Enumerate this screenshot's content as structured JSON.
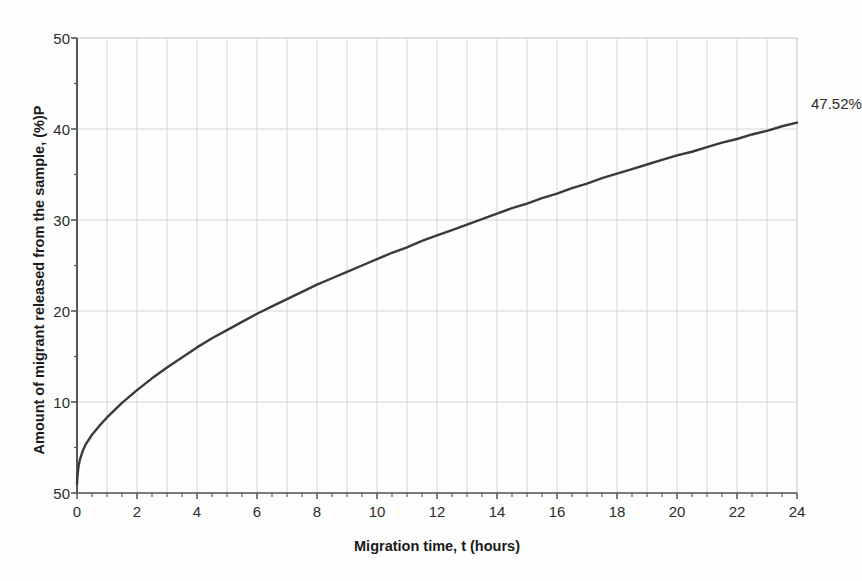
{
  "chart_data": {
    "type": "line",
    "title": "",
    "xlabel": "Migration time, t   (hours)",
    "ylabel": "Amount of migrant released from the sample, (%)P",
    "xlim": [
      0,
      24
    ],
    "ylim": [
      0,
      50
    ],
    "grid": true,
    "legend": null,
    "xticks": [
      0,
      2,
      4,
      6,
      8,
      10,
      12,
      14,
      16,
      18,
      20,
      22,
      24
    ],
    "xtick_labels": [
      "0",
      "2",
      "4",
      "6",
      "8",
      "10",
      "12",
      "14",
      "16",
      "18",
      "20",
      "22",
      "24"
    ],
    "yticks": [
      0,
      10,
      20,
      30,
      40,
      50
    ],
    "ytick_labels": [
      "50",
      "10",
      "20",
      "30",
      "40",
      "50"
    ],
    "x_minor_tick_step": 0.5,
    "y_minor_tick_step": 5,
    "x_gridline_step": 1,
    "y_gridline_step": 10,
    "line_color": "#3a3a3a",
    "grid_color": "#d6d6d6",
    "axis_color": "#555555",
    "background_color": "#fefefe",
    "annotations": [
      {
        "text": "47.52%",
        "x": 24.0,
        "y": 45.3,
        "dx": 14,
        "dy": 14
      }
    ],
    "series": [
      {
        "name": "Migrant release",
        "x": [
          0,
          0.02,
          0.05,
          0.1,
          0.2,
          0.3,
          0.5,
          0.75,
          1,
          1.5,
          2,
          2.5,
          3,
          3.5,
          4,
          4.5,
          5,
          5.5,
          6,
          6.5,
          7,
          7.5,
          8,
          8.5,
          9,
          9.5,
          10,
          10.5,
          11,
          11.5,
          12,
          12.5,
          13,
          13.5,
          14,
          14.5,
          15,
          15.5,
          16,
          16.5,
          17,
          17.5,
          18,
          18.5,
          19,
          19.5,
          20,
          20.5,
          21,
          21.5,
          22,
          22.5,
          23,
          23.5,
          24
        ],
        "y": [
          1.0,
          2.0,
          2.9,
          3.7,
          4.7,
          5.4,
          6.4,
          7.4,
          8.3,
          9.9,
          11.3,
          12.6,
          13.8,
          14.9,
          16.0,
          17.0,
          17.9,
          18.8,
          19.7,
          20.5,
          21.3,
          22.1,
          22.9,
          23.6,
          24.3,
          25.0,
          25.7,
          26.4,
          27.0,
          27.7,
          28.3,
          28.9,
          29.5,
          30.1,
          30.7,
          31.3,
          31.8,
          32.4,
          32.9,
          33.5,
          34.0,
          34.6,
          35.1,
          35.6,
          36.1,
          36.6,
          37.1,
          37.5,
          38.0,
          38.5,
          38.9,
          39.4,
          39.8,
          40.3,
          40.7
        ],
        "final_value": 47.52
      }
    ]
  },
  "labels": {
    "annotation_final": "47.52%"
  }
}
